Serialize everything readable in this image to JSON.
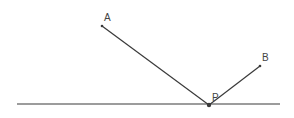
{
  "diagram": {
    "type": "geometry-reflection",
    "colors": {
      "line": "#3a3a3a",
      "text": "#444444",
      "background": "#ffffff"
    },
    "baseline": {
      "x1": 17,
      "y1": 104,
      "x2": 280,
      "y2": 104
    },
    "points": [
      {
        "id": "A",
        "label": "A",
        "x": 102,
        "y": 26,
        "label_x": 104,
        "label_y": 21
      },
      {
        "id": "B",
        "label": "B",
        "x": 260,
        "y": 66,
        "label_x": 262,
        "label_y": 61
      },
      {
        "id": "P",
        "label": "P",
        "x": 209,
        "y": 105,
        "label_x": 212,
        "label_y": 101
      }
    ],
    "segments": [
      {
        "from": "A",
        "to": "P"
      },
      {
        "from": "P",
        "to": "B"
      }
    ]
  }
}
